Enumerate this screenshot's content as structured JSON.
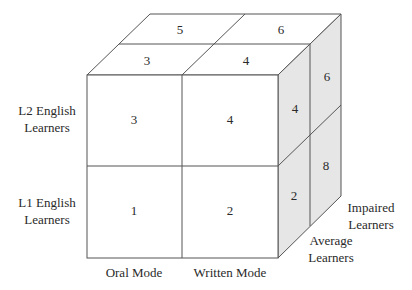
{
  "diagram": {
    "type": "3d-cube-matrix",
    "colors": {
      "side_shade": "#e6e6e6",
      "edge": "#555555",
      "text": "#2a2a2a"
    },
    "row_labels": [
      {
        "line1": "L2 English",
        "line2": "Learners"
      },
      {
        "line1": "L1 English",
        "line2": "Learners"
      }
    ],
    "column_labels": [
      "Oral Mode",
      "Written Mode"
    ],
    "depth_labels": [
      {
        "line1": "Average",
        "line2": "Learners"
      },
      {
        "line1": "Impaired",
        "line2": "Learners"
      }
    ],
    "front_face": {
      "top_left": "3",
      "top_right": "4",
      "bottom_left": "1",
      "bottom_right": "2"
    },
    "top_face": {
      "front_left": "3",
      "front_right": "4",
      "back_left": "5",
      "back_right": "6"
    },
    "side_face": {
      "front_top": "4",
      "back_top": "6",
      "front_bottom": "2",
      "back_bottom": "8"
    }
  }
}
